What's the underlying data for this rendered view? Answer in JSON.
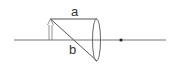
{
  "diagram": {
    "type": "convex-lens-ray-diagram",
    "labels": {
      "ray_a": "a",
      "ray_b": "b"
    },
    "colors": {
      "stroke": "#555555",
      "focal_point": "#222222",
      "background": "#ffffff"
    }
  }
}
